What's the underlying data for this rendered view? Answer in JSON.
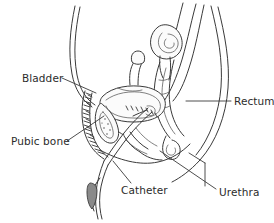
{
  "figure": {
    "view": "sagittal side view",
    "background_color": "#ffffff",
    "line_color": "#3a3a3a",
    "text_color": "#2b2b2b"
  },
  "labels": [
    {
      "id": "bladder",
      "text": "Bladder",
      "text_x": 22,
      "text_y": 82,
      "anchor": "start",
      "leader": "M 62 78 L 96 93"
    },
    {
      "id": "pubic-bone",
      "text": "Pubic bone",
      "text_x": 11,
      "text_y": 145,
      "anchor": "start",
      "leader": "M 67 141 L 104 116"
    },
    {
      "id": "catheter",
      "text": "Catheter",
      "text_x": 121,
      "text_y": 194,
      "anchor": "start",
      "leader": "M 131 183 L 113 161"
    },
    {
      "id": "rectum",
      "text": "Rectum",
      "text_x": 234,
      "text_y": 105,
      "anchor": "start",
      "leader": "M 186 101 L 231 101"
    },
    {
      "id": "urethra",
      "text": "Urethra",
      "text_x": 219,
      "text_y": 196,
      "anchor": "start",
      "leader": "M 216 189 L 160 151"
    }
  ],
  "annotations": {
    "urethra_tick": "M 205 186 L 205 163",
    "urethra_tick2": "M 205 163 L 189 153"
  }
}
